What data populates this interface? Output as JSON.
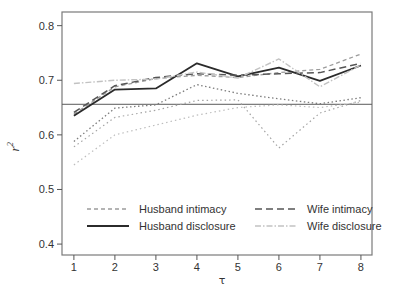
{
  "chart_data": {
    "type": "line",
    "title": "",
    "x": [
      1,
      2,
      3,
      4,
      5,
      6,
      7,
      8
    ],
    "xlabel": "τ",
    "ylabel_base": "r",
    "ylabel_sup": "2",
    "xlim": [
      0.71,
      8.27
    ],
    "ylim": [
      0.38,
      0.825
    ],
    "yticks": [
      0.4,
      0.5,
      0.6,
      0.7,
      0.8
    ],
    "ytick_labels": [
      "0.4",
      "0.5",
      "0.6",
      "0.7",
      "0.8"
    ],
    "xticks": [
      1,
      2,
      3,
      4,
      5,
      6,
      7,
      8
    ],
    "xtick_labels": [
      "1",
      "2",
      "3",
      "4",
      "5",
      "6",
      "7",
      "8"
    ],
    "grid": false,
    "legend_position": "inside-bottom-left",
    "axis_color": "#7a7a7a",
    "tick_color": "#555555",
    "label_color": "#333333",
    "series": [
      {
        "name": "Husband intimacy",
        "color": "#9c9c9c",
        "dash": "4 3",
        "width": 1.3,
        "values": [
          0.638,
          0.688,
          0.703,
          0.709,
          0.705,
          0.714,
          0.72,
          0.748
        ],
        "in_legend": true
      },
      {
        "name": "Husband disclosure",
        "color": "#2b2b2b",
        "dash": "",
        "width": 1.8,
        "values": [
          0.635,
          0.683,
          0.685,
          0.731,
          0.707,
          0.723,
          0.699,
          0.727
        ],
        "in_legend": true
      },
      {
        "name": "Wife intimacy",
        "color": "#555555",
        "dash": "7 4",
        "width": 1.5,
        "values": [
          0.641,
          0.69,
          0.705,
          0.712,
          0.709,
          0.712,
          0.714,
          0.731
        ],
        "in_legend": true
      },
      {
        "name": "Wife disclosure",
        "color": "#c2c2c2",
        "dash": "6 2 1.5 2",
        "width": 1.4,
        "values": [
          0.694,
          0.7,
          0.702,
          0.715,
          0.704,
          0.739,
          0.688,
          0.728
        ],
        "in_legend": true
      },
      {
        "name": "unlabeled-dotted-dark",
        "color": "#7d7d7d",
        "dash": "1.5 2.5",
        "width": 1.3,
        "values": [
          0.588,
          0.649,
          0.655,
          0.692,
          0.676,
          0.666,
          0.657,
          0.668
        ],
        "in_legend": false
      },
      {
        "name": "unlabeled-dotted-medium",
        "color": "#a3a3a3",
        "dash": "1.5 3",
        "width": 1.2,
        "values": [
          0.578,
          0.632,
          0.645,
          0.663,
          0.664,
          0.576,
          0.64,
          0.663
        ],
        "in_legend": false
      },
      {
        "name": "unlabeled-dotted-light",
        "color": "#bdbdbd",
        "dash": "1.5 3",
        "width": 1.2,
        "values": [
          0.545,
          0.6,
          0.618,
          0.636,
          0.65,
          0.655,
          0.65,
          0.66
        ],
        "in_legend": false
      }
    ],
    "reference_line": {
      "value": 0.656,
      "color": "#5a5a5a",
      "width": 1
    }
  },
  "legend": {
    "entries": [
      {
        "label": "Husband intimacy",
        "series_index": 0
      },
      {
        "label": "Husband disclosure",
        "series_index": 1
      },
      {
        "label": "Wife intimacy",
        "series_index": 2
      },
      {
        "label": "Wife disclosure",
        "series_index": 3
      }
    ]
  }
}
